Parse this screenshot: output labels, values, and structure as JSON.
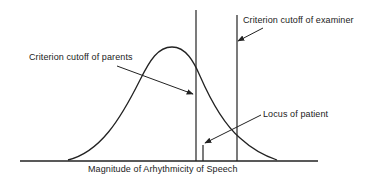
{
  "diagram": {
    "labels": {
      "parents_cutoff": "Criterion cutoff of parents",
      "examiner_cutoff": "Criterion cutoff of examiner",
      "patient_locus": "Locus of patient",
      "x_axis": "Magnitude of Arhythmicity of Speech"
    },
    "colors": {
      "stroke": "#222222",
      "background": "#ffffff"
    }
  }
}
